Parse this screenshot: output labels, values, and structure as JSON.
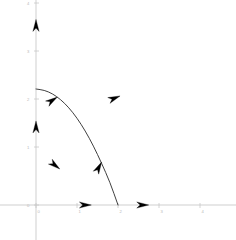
{
  "chart_data": {
    "type": "line",
    "title": "",
    "xlabel": "",
    "ylabel": "",
    "xlim": [
      -0.6,
      4.2
    ],
    "ylim": [
      -0.7,
      4.3
    ],
    "grid": false,
    "legend": null,
    "axis_color": "#c9c9c9",
    "curve_color": "#2a2a2a",
    "arrow_color": "#000000",
    "x_ticks": [
      {
        "value": 0,
        "label": "0",
        "px": 36
      },
      {
        "value": 1,
        "label": "1",
        "px": 77
      },
      {
        "value": 2,
        "label": "2",
        "px": 118
      },
      {
        "value": 3,
        "label": "3",
        "px": 159
      },
      {
        "value": 4,
        "label": "4",
        "px": 200
      }
    ],
    "y_ticks": [
      {
        "value": 0,
        "label": "0",
        "px": 205
      },
      {
        "value": 1,
        "label": "1",
        "px": 147
      },
      {
        "value": 2,
        "label": "2",
        "px": 99
      },
      {
        "value": 3,
        "label": "3",
        "px": 51
      },
      {
        "value": 4,
        "label": "4",
        "px": 3
      }
    ],
    "series": [
      {
        "name": "solution curve",
        "points": [
          [
            0.0,
            2.0
          ],
          [
            0.2,
            1.98
          ],
          [
            0.4,
            1.92
          ],
          [
            0.6,
            1.82
          ],
          [
            0.8,
            1.68
          ],
          [
            1.0,
            1.5
          ],
          [
            1.2,
            1.28
          ],
          [
            1.4,
            1.02
          ],
          [
            1.6,
            0.72
          ],
          [
            1.8,
            0.4
          ],
          [
            2.0,
            0.0
          ]
        ]
      }
    ],
    "direction_arrows": [
      {
        "name": "y-axis-upper-arrow",
        "x": 0.0,
        "y": 3.2,
        "angle_deg": 90
      },
      {
        "name": "y-axis-lower-arrow",
        "x": 0.0,
        "y": 1.45,
        "angle_deg": 90
      },
      {
        "name": "curve-upper-arrow",
        "x": 0.52,
        "y": 1.86,
        "angle_deg": 33
      },
      {
        "name": "curve-lower-arrow",
        "x": 1.6,
        "y": 0.74,
        "angle_deg": 62
      },
      {
        "name": "field-arrow-right",
        "x": 2.05,
        "y": 1.88,
        "angle_deg": 22
      },
      {
        "name": "field-arrow-lower-left",
        "x": 0.58,
        "y": 0.62,
        "angle_deg": -38
      },
      {
        "name": "x-axis-left-arrow",
        "x": 1.35,
        "y": 0.0,
        "angle_deg": 0
      },
      {
        "name": "x-axis-right-arrow",
        "x": 2.75,
        "y": 0.0,
        "angle_deg": 0
      }
    ]
  }
}
